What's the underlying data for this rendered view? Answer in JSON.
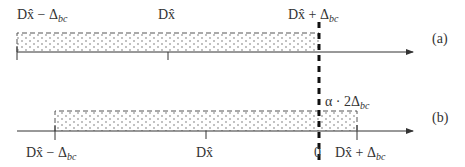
{
  "panels": [
    {
      "id": "a",
      "label": "(a)",
      "interval": {
        "from": "Dx̂ − Δbc",
        "to": "Dx̂ + Δbc"
      },
      "tick_labels": [
        {
          "base": "Dx̂ − Δ",
          "sub": "bc"
        },
        {
          "base": "Dx̂",
          "sub": ""
        },
        {
          "base": "Dx̂ + Δ",
          "sub": "bc"
        }
      ]
    },
    {
      "id": "b",
      "label": "(b)",
      "interval": {
        "from": "Dx̂ − Δbc",
        "to": "Dx̂ + Δbc"
      },
      "tick_labels": [
        {
          "base": "Dx̂ − Δ",
          "sub": "bc"
        },
        {
          "base": "Dx̂",
          "sub": ""
        },
        {
          "base": "0",
          "sub": ""
        },
        {
          "base": "Dx̂ + Δ",
          "sub": "bc"
        }
      ],
      "annotation": {
        "base": "α · 2Δ",
        "sub": "bc"
      }
    }
  ],
  "colors": {
    "line": "#333333",
    "dots": "#555555",
    "dash": "#111111"
  }
}
